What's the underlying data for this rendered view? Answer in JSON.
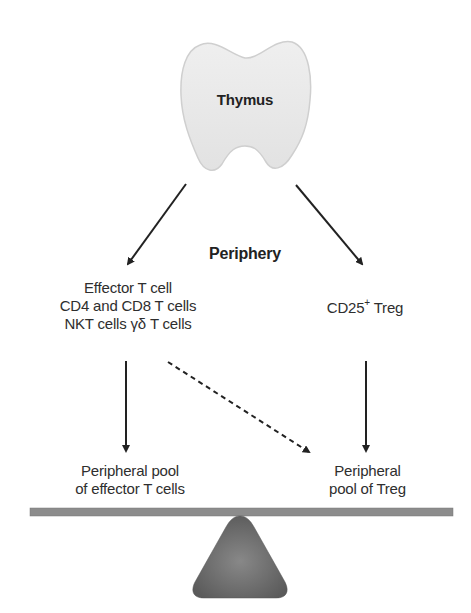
{
  "diagram": {
    "thymus": {
      "label": "Thymus",
      "fill": "#e9e9e9",
      "stroke": "#c8c8c8"
    },
    "periphery_label": "Periphery",
    "effector": {
      "line1": "Effector T cell",
      "line2": "CD4 and CD8 T cells",
      "line3": "NKT cells γδ T cells"
    },
    "treg": {
      "prefix": "CD25",
      "superscript": "+",
      "suffix": " Treg"
    },
    "pool_effector": {
      "line1": "Peripheral pool",
      "line2": "of effector T cells"
    },
    "pool_treg": {
      "line1": "Peripheral",
      "line2": "pool of Treg"
    },
    "arrows": [
      {
        "from": "thymus",
        "to": "effector",
        "style": "solid"
      },
      {
        "from": "thymus",
        "to": "treg",
        "style": "solid"
      },
      {
        "from": "effector",
        "to": "pool_effector",
        "style": "solid"
      },
      {
        "from": "treg",
        "to": "pool_treg",
        "style": "solid"
      },
      {
        "from": "effector",
        "to": "pool_treg",
        "style": "dashed"
      }
    ],
    "balance": {
      "beam_color": "#8a8a8a",
      "fulcrum_color": "#6a6a6a"
    }
  }
}
